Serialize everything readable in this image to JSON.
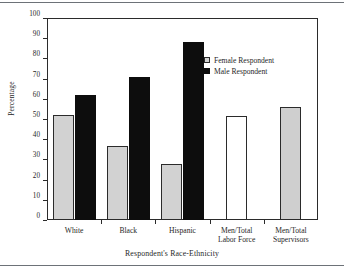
{
  "chart_data": {
    "type": "bar",
    "title": "",
    "xlabel": "Respondent's Race-Ethnicity",
    "ylabel": "Percentage",
    "ylim": [
      0,
      100
    ],
    "ytick_step": 10,
    "yticks": [
      0,
      10,
      20,
      30,
      40,
      50,
      60,
      70,
      80,
      90,
      100
    ],
    "grid": false,
    "legend_position": "upper right inside",
    "categories": [
      "White",
      "Black",
      "Hispanic",
      "Men/Total\nLabor Force",
      "Men/Total\nSupervisors"
    ],
    "series": [
      {
        "name": "Female Respondent",
        "style": "light-gray-fill",
        "values": [
          52,
          36.5,
          27.5,
          null,
          null
        ]
      },
      {
        "name": "Male Respondent",
        "style": "black-fill",
        "values": [
          62,
          71,
          88,
          null,
          null
        ]
      },
      {
        "name": "Ratio bars",
        "style": "single",
        "values": [
          null,
          null,
          null,
          51.5,
          56
        ]
      }
    ],
    "bars": [
      {
        "group": "White",
        "series": "Female Respondent",
        "value": 52,
        "fill": "#d2d2d2"
      },
      {
        "group": "White",
        "series": "Male Respondent",
        "value": 62,
        "fill": "#0d0d0d"
      },
      {
        "group": "Black",
        "series": "Female Respondent",
        "value": 36.5,
        "fill": "#d2d2d2"
      },
      {
        "group": "Black",
        "series": "Male Respondent",
        "value": 71,
        "fill": "#0d0d0d"
      },
      {
        "group": "Hispanic",
        "series": "Female Respondent",
        "value": 27.5,
        "fill": "#d2d2d2"
      },
      {
        "group": "Hispanic",
        "series": "Male Respondent",
        "value": 88,
        "fill": "#0d0d0d"
      },
      {
        "group": "Men/Total Labor Force",
        "series": "Ratio",
        "value": 51.5,
        "fill": "#ffffff"
      },
      {
        "group": "Men/Total Supervisors",
        "series": "Ratio",
        "value": 56,
        "fill": "#cfcfcf"
      }
    ]
  },
  "axes": {
    "y_tick_labels": [
      "100",
      "90",
      "80",
      "70",
      "60",
      "50",
      "40",
      "30",
      "20",
      "10",
      "0"
    ],
    "y_axis_title": "Percentage",
    "x_axis_title": "Respondent's Race-Ethnicity",
    "x_tick_labels": [
      "White",
      "Black",
      "Hispanic",
      "Men/Total\nLabor Force",
      "Men/Total\nSupervisors"
    ]
  },
  "legend": {
    "items": [
      {
        "label": "Female Respondent",
        "swatch": "#d2d2d2"
      },
      {
        "label": "Male Respondent",
        "swatch": "#0d0d0d"
      }
    ]
  },
  "colors": {
    "female_fill": "#d2d2d2",
    "male_fill": "#0d0d0d",
    "hollow_fill": "#ffffff",
    "shaded_fill": "#cfcfcf",
    "axis_line": "#2b2b2b",
    "rule_line": "#6d7278",
    "text": "#1f1f1f",
    "background": "#ffffff"
  }
}
